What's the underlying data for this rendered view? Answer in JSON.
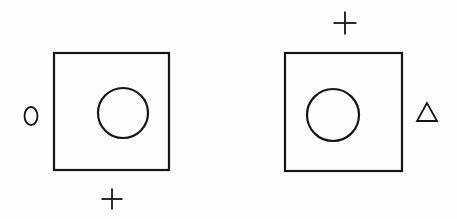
{
  "figure": {
    "panels": [
      {
        "name": "left",
        "square": {
          "x": 54,
          "y": 53,
          "w": 115,
          "h": 117
        },
        "inner_circle": {
          "cx": 123,
          "cy": 113,
          "r": 25
        },
        "markers": [
          {
            "type": "oval",
            "label": "0",
            "cx": 31,
            "cy": 116,
            "rx": 6.5,
            "ry": 9
          },
          {
            "type": "plus",
            "label": "+",
            "cx": 112,
            "cy": 199,
            "size": 21
          }
        ]
      },
      {
        "name": "right",
        "square": {
          "x": 285,
          "y": 53,
          "w": 117,
          "h": 118
        },
        "inner_circle": {
          "cx": 333,
          "cy": 115,
          "r": 26
        },
        "markers": [
          {
            "type": "plus",
            "label": "+",
            "cx": 345,
            "cy": 23,
            "size": 23
          },
          {
            "type": "triangle",
            "label": "△",
            "points": "427,103 417,121 437,121"
          }
        ]
      }
    ],
    "colors": {
      "ink": "#151515",
      "paper": "#fdfdfd"
    }
  }
}
